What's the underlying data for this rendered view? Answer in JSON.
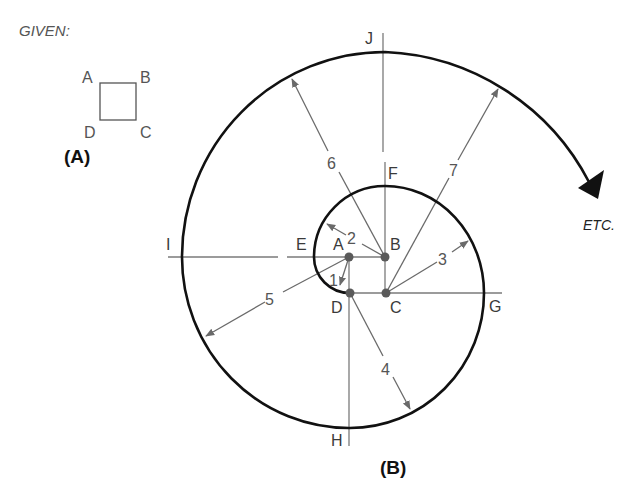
{
  "given": {
    "title": "GIVEN:",
    "square_labels": {
      "A": "A",
      "B": "B",
      "C": "C",
      "D": "D"
    },
    "figure_label": "(A)"
  },
  "spiral": {
    "figure_label": "(B)",
    "continuation_label": "ETC.",
    "corner_labels": {
      "A": "A",
      "B": "B",
      "C": "C",
      "D": "D"
    },
    "construction_points": {
      "E": "E",
      "F": "F",
      "G": "G",
      "H": "H",
      "I": "I",
      "J": "J"
    },
    "radius_labels": [
      "1",
      "2",
      "3",
      "4",
      "5",
      "6",
      "7"
    ],
    "arc_sequence": [
      {
        "from": "D",
        "to": "E",
        "center": "A",
        "radius_label": "1"
      },
      {
        "from": "E",
        "to": "F",
        "center": "B",
        "radius_label": "2"
      },
      {
        "from": "F",
        "to": "G",
        "center": "C",
        "radius_label": "3"
      },
      {
        "from": "G",
        "to": "H",
        "center": "D",
        "radius_label": "4"
      },
      {
        "from": "H",
        "to": "I",
        "center": "A",
        "radius_label": "5"
      },
      {
        "from": "I",
        "to": "J",
        "center": "B",
        "radius_label": "6"
      },
      {
        "from": "J",
        "to": "ETC.",
        "center": "C",
        "radius_label": "7"
      }
    ]
  },
  "colors": {
    "curve": "#111111",
    "construction_line": "#777777",
    "center_dot": "#555555",
    "text": "#3a3a3a"
  }
}
